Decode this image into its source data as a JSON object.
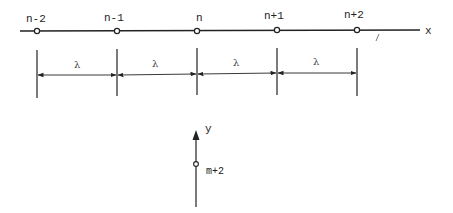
{
  "diagram": {
    "type": "1D lattice grid with spacing",
    "x_axis": {
      "label": "x",
      "nodes": [
        {
          "label": "n-2",
          "x": 37
        },
        {
          "label": "n-1",
          "x": 117
        },
        {
          "label": "n",
          "x": 197
        },
        {
          "label": "n+1",
          "x": 277
        },
        {
          "label": "n+2",
          "x": 357
        }
      ]
    },
    "spacing": {
      "label": "λ",
      "intervals": [
        {
          "from": "n-2",
          "to": "n-1",
          "label": "λ"
        },
        {
          "from": "n-1",
          "to": "n",
          "label": "λ"
        },
        {
          "from": "n",
          "to": "n+1",
          "label": "λ"
        },
        {
          "from": "n+1",
          "to": "n+2",
          "label": "λ"
        }
      ]
    },
    "y_axis": {
      "label": "y",
      "nodes": [
        {
          "label": "m+2"
        }
      ]
    },
    "colors": {
      "line": "#222222",
      "text": "#222222",
      "background": "#ffffff"
    }
  }
}
